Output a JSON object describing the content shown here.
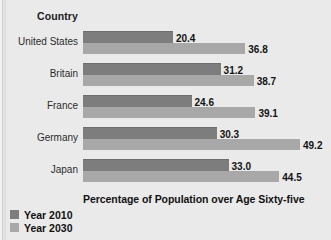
{
  "header": {
    "category_label": "Country"
  },
  "axis_title": "Percentage of Population over Age Sixty-five",
  "legend": {
    "items": [
      {
        "label": "Year 2010",
        "color": "#7d7d7d"
      },
      {
        "label": "Year 2030",
        "color": "#a8a8a8"
      }
    ]
  },
  "rows": [
    {
      "country": "United States",
      "v2010": "20.4",
      "v2030": "36.8"
    },
    {
      "country": "Britain",
      "v2010": "31.2",
      "v2030": "38.7"
    },
    {
      "country": "France",
      "v2010": "24.6",
      "v2030": "39.1"
    },
    {
      "country": "Germany",
      "v2010": "30.3",
      "v2030": "49.2"
    },
    {
      "country": "Japan",
      "v2010": "33.0",
      "v2030": "44.5"
    }
  ],
  "chart_data": {
    "type": "bar",
    "orientation": "horizontal",
    "title": "",
    "xlabel": "Percentage of Population over Age Sixty-five",
    "ylabel": "Country",
    "categories": [
      "United States",
      "Britain",
      "France",
      "Germany",
      "Japan"
    ],
    "series": [
      {
        "name": "Year 2010",
        "color": "#7d7d7d",
        "values": [
          20.4,
          31.2,
          24.6,
          30.3,
          33.0
        ]
      },
      {
        "name": "Year 2030",
        "color": "#a8a8a8",
        "values": [
          36.8,
          38.7,
          39.1,
          49.2,
          44.5
        ]
      }
    ],
    "xlim": [
      0,
      49.2
    ],
    "grid": false,
    "legend_position": "bottom-left",
    "data_labels": true,
    "axis_ticks_visible": false
  }
}
